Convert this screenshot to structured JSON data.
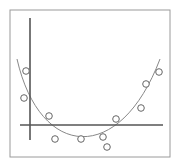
{
  "chart_data": {
    "type": "scatter",
    "title": "",
    "xlabel": "",
    "ylabel": "",
    "grid": false,
    "legend": null,
    "frame": {
      "x": 10,
      "y": 10,
      "w": 160,
      "h": 147,
      "color": "#9a9a9a"
    },
    "axes": {
      "color": "#555555",
      "y_axis": {
        "x": 30,
        "y1": 18,
        "y2": 140
      },
      "x_axis": {
        "y": 125,
        "x1": 20,
        "x2": 163
      }
    },
    "points": [
      {
        "x": 26,
        "y": 71
      },
      {
        "x": 24,
        "y": 98
      },
      {
        "x": 49,
        "y": 116
      },
      {
        "x": 55,
        "y": 139
      },
      {
        "x": 81,
        "y": 139
      },
      {
        "x": 103,
        "y": 137
      },
      {
        "x": 107,
        "y": 147
      },
      {
        "x": 116,
        "y": 119
      },
      {
        "x": 141,
        "y": 108
      },
      {
        "x": 146,
        "y": 84
      },
      {
        "x": 159,
        "y": 72
      }
    ],
    "fit_curve": {
      "type": "quadratic",
      "path": "M17,59 C40,160 120,165 160,59",
      "color": "#888888"
    },
    "marker": {
      "shape": "open-circle",
      "radius": 3.3,
      "stroke": "#666666"
    }
  }
}
